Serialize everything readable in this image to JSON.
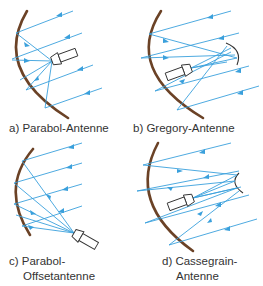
{
  "figure": {
    "colors": {
      "reflector": "#6b4226",
      "rays": "#3aa0dc",
      "feed_outline": "#333333",
      "text": "#333333",
      "background": "#ffffff"
    },
    "panels": [
      {
        "id": "a",
        "label": "a) Parabol-Antenne",
        "type": "parabolic"
      },
      {
        "id": "b",
        "label": "b) Gregory-Antenne",
        "type": "gregorian"
      },
      {
        "id": "c",
        "label_line1": "c) Parabol-",
        "label_line2": "Offsetantenne",
        "type": "offset-parabolic"
      },
      {
        "id": "d",
        "label_line1": "d) Cassegrain-",
        "label_line2": "Antenne",
        "type": "cassegrain"
      }
    ]
  }
}
